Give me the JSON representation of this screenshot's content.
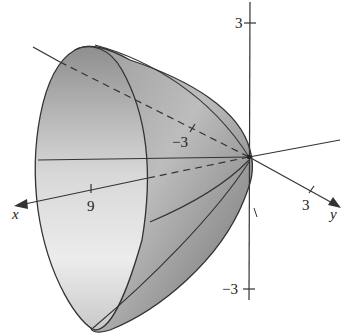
{
  "figure": {
    "surface_fill_light": "#e6e6e6",
    "surface_fill_dark": "#8a8a8a",
    "line_color": "#333333"
  },
  "axes": {
    "x": {
      "label": "x",
      "ticks": [
        {
          "value": "9"
        }
      ]
    },
    "y": {
      "label": "y",
      "ticks": [
        {
          "value": "3"
        },
        {
          "value": "−3"
        }
      ]
    },
    "z": {
      "ticks": [
        {
          "value": "3"
        },
        {
          "value": "−3"
        }
      ]
    }
  }
}
